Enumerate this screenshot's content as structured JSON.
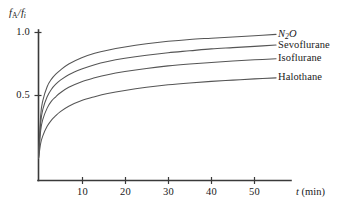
{
  "chart_data": {
    "type": "line",
    "title": "",
    "subtitle": "",
    "xlabel": "t (min)",
    "xlabel_symbol": "t",
    "xlabel_unit": "(min)",
    "ylabel": "fA/fi",
    "ylabel_numerator_symbol": "f",
    "ylabel_numerator_sub": "A",
    "ylabel_denominator_symbol": "f",
    "ylabel_denominator_sub": "i",
    "xlim": [
      0,
      58
    ],
    "ylim": [
      0,
      1.12
    ],
    "xticks": [
      10,
      20,
      30,
      40,
      50
    ],
    "xtick_labels": [
      "10",
      "20",
      "30",
      "40",
      "50"
    ],
    "yticks": [
      0.5,
      1.0
    ],
    "ytick_labels": [
      "0.5",
      "1.0"
    ],
    "grid": false,
    "legend_position": "right-inline-end-of-curve",
    "series": [
      {
        "name": "N2O",
        "label_text": "N O",
        "label_main": "N",
        "label_sub": "2",
        "label_tail": "O",
        "label_italic": true,
        "color": "#555555",
        "x": [
          0,
          0.5,
          1,
          2,
          3,
          4,
          5,
          7,
          10,
          13,
          16,
          20,
          25,
          30,
          35,
          40,
          45,
          50,
          55
        ],
        "y": [
          0.0,
          0.34,
          0.46,
          0.57,
          0.63,
          0.67,
          0.7,
          0.75,
          0.8,
          0.835,
          0.86,
          0.885,
          0.91,
          0.93,
          0.945,
          0.955,
          0.965,
          0.975,
          0.985
        ]
      },
      {
        "name": "Sevoflurane",
        "label_text": "Sevoflurane",
        "label_italic": false,
        "color": "#555555",
        "x": [
          0,
          0.5,
          1,
          2,
          3,
          4,
          5,
          7,
          10,
          13,
          16,
          20,
          25,
          30,
          35,
          40,
          45,
          50,
          55
        ],
        "y": [
          0.0,
          0.28,
          0.39,
          0.49,
          0.55,
          0.59,
          0.62,
          0.665,
          0.71,
          0.745,
          0.77,
          0.795,
          0.82,
          0.84,
          0.855,
          0.87,
          0.88,
          0.89,
          0.9
        ]
      },
      {
        "name": "Isoflurane",
        "label_text": "Isoflurane",
        "label_italic": false,
        "color": "#555555",
        "x": [
          0,
          0.5,
          1,
          2,
          3,
          4,
          5,
          7,
          10,
          13,
          16,
          20,
          25,
          30,
          35,
          40,
          45,
          50,
          55
        ],
        "y": [
          0.0,
          0.22,
          0.31,
          0.4,
          0.455,
          0.49,
          0.52,
          0.565,
          0.61,
          0.64,
          0.665,
          0.69,
          0.715,
          0.735,
          0.75,
          0.762,
          0.773,
          0.783,
          0.792
        ]
      },
      {
        "name": "Halothane",
        "label_text": "Halothane",
        "label_italic": false,
        "color": "#555555",
        "x": [
          0,
          0.5,
          1,
          2,
          3,
          4,
          5,
          7,
          10,
          13,
          16,
          20,
          25,
          30,
          35,
          40,
          45,
          50,
          55
        ],
        "y": [
          0.0,
          0.12,
          0.18,
          0.255,
          0.305,
          0.34,
          0.37,
          0.415,
          0.46,
          0.49,
          0.515,
          0.54,
          0.565,
          0.585,
          0.6,
          0.612,
          0.622,
          0.632,
          0.64
        ]
      }
    ]
  },
  "axes": {
    "x_axis_name": "time-axis",
    "y_axis_name": "fraction-axis"
  }
}
